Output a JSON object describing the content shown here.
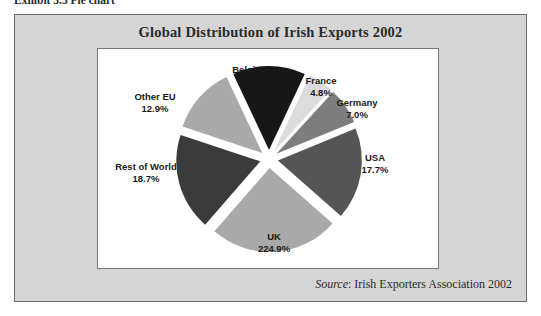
{
  "caption": {
    "text": "Exhibit 3.3  Pie chart"
  },
  "figure": {
    "title": "Global Distribution of Irish Exports 2002",
    "source_label": "Source",
    "source_text": ": Irish Exporters Association 2002"
  },
  "colors": {
    "panel_background": "#d5d5d5",
    "panel_border": "#6d6d6d",
    "plot_background": "#ffffff",
    "plot_border": "#777777",
    "title_text": "#2b2b2b",
    "label_text": "#1a1a1a"
  },
  "chart_data": {
    "type": "pie",
    "title": "Global Distribution of Irish Exports 2002",
    "xlabel": "",
    "ylabel": "",
    "legend": "none",
    "exploded": true,
    "labels": [
      "Belgium",
      "France",
      "Germany",
      "USA",
      "UK",
      "Rest of World",
      "Other EU"
    ],
    "values": [
      14.0,
      4.8,
      7.0,
      17.7,
      224.9,
      18.7,
      12.9
    ],
    "value_suffix": "%",
    "slices": [
      {
        "name": "Belgium",
        "label": "Belgium",
        "value": "14.0%",
        "numeric": 14.0,
        "color": "#171717"
      },
      {
        "name": "France",
        "label": "France",
        "value": "4.8%",
        "numeric": 4.8,
        "color": "#dcdcdc"
      },
      {
        "name": "Germany",
        "label": "Germany",
        "value": "7.0%",
        "numeric": 7.0,
        "color": "#7d7d7d"
      },
      {
        "name": "USA",
        "label": "USA",
        "value": "17.7%",
        "numeric": 17.7,
        "color": "#555555"
      },
      {
        "name": "UK",
        "label": "UK",
        "value": "224.9%",
        "numeric": 24.9,
        "color": "#a9a9a9"
      },
      {
        "name": "Rest of World",
        "label": "Rest of World",
        "value": "18.7%",
        "numeric": 18.7,
        "color": "#3b3b3b"
      },
      {
        "name": "Other EU",
        "label": "Other EU",
        "value": "12.9%",
        "numeric": 12.9,
        "color": "#a9a9a9"
      }
    ]
  }
}
